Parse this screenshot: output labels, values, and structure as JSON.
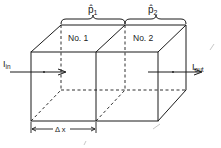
{
  "diagram": {
    "cells": [
      {
        "label": "No. 1",
        "hat_label": "p̂",
        "hat_sub": "1"
      },
      {
        "label": "No. 2",
        "hat_label": "p̂",
        "hat_sub": "2"
      }
    ],
    "input": {
      "symbol": "I",
      "sub": "in"
    },
    "output": {
      "symbol": "I",
      "sub": "out"
    },
    "dimension": {
      "label": "Δ x"
    },
    "colors": {
      "line": "#1a1a1a",
      "artifact": "#c8c8c8"
    }
  }
}
